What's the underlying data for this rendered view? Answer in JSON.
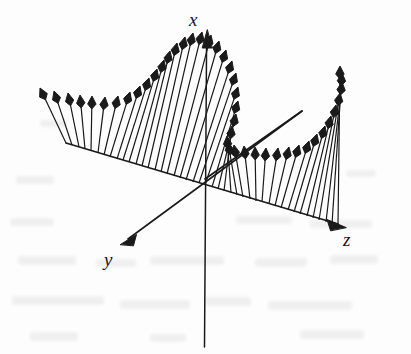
{
  "figure": {
    "kind": "vector-field-3d",
    "title": "",
    "caption": "",
    "background_color": "#fdfdfd",
    "ink_color": "#1a1a1a",
    "width": 411,
    "height": 354
  },
  "axes": {
    "origin": {
      "x": 205,
      "y": 179
    },
    "items": [
      {
        "name": "x",
        "label": "x",
        "label_position": {
          "x": 189,
          "y": 10
        },
        "tip": {
          "x": 207,
          "y": 31
        },
        "tail": {
          "x": 204,
          "y": 347
        },
        "has_arrowhead": true
      },
      {
        "name": "y",
        "label": "y",
        "label_position": {
          "x": 104,
          "y": 250
        },
        "tip": {
          "x": 121,
          "y": 244
        },
        "tail": {
          "x": 302,
          "y": 111
        },
        "has_arrowhead": true
      },
      {
        "name": "z",
        "label": "z",
        "label_position": {
          "x": 343,
          "y": 230
        },
        "tip": {
          "x": 345,
          "y": 227
        },
        "tail": {
          "x": 66,
          "y": 143
        },
        "has_arrowhead": true
      }
    ]
  },
  "chart_data": {
    "type": "scatter",
    "title": "",
    "xlabel": "z",
    "ylabel": "x",
    "zlabel": "y",
    "grid": false,
    "legend_position": "none",
    "base_line": {
      "from": {
        "x": 66,
        "y": 143
      },
      "to": {
        "x": 345,
        "y": 227
      }
    },
    "vector_count": 44,
    "vectors": [
      {
        "t": 0.0,
        "bx": 66,
        "by": 143,
        "tx": 40,
        "ty": 88,
        "len": 61
      },
      {
        "t": 0.022,
        "bx": 72,
        "by": 145,
        "tx": 54,
        "ty": 91,
        "len": 57
      },
      {
        "t": 0.045,
        "bx": 79,
        "by": 147,
        "tx": 68,
        "ty": 93,
        "len": 55
      },
      {
        "t": 0.067,
        "bx": 85,
        "by": 149,
        "tx": 80,
        "ty": 95,
        "len": 54
      },
      {
        "t": 0.09,
        "bx": 91,
        "by": 151,
        "tx": 92,
        "ty": 96,
        "len": 55
      },
      {
        "t": 0.112,
        "bx": 98,
        "by": 153,
        "tx": 105,
        "ty": 97,
        "len": 56
      },
      {
        "t": 0.135,
        "bx": 104,
        "by": 155,
        "tx": 118,
        "ty": 96,
        "len": 60
      },
      {
        "t": 0.157,
        "bx": 110,
        "by": 157,
        "tx": 130,
        "ty": 92,
        "len": 68
      },
      {
        "t": 0.18,
        "bx": 117,
        "by": 159,
        "tx": 140,
        "ty": 86,
        "len": 76
      },
      {
        "t": 0.202,
        "bx": 123,
        "by": 160,
        "tx": 149,
        "ty": 78,
        "len": 86
      },
      {
        "t": 0.225,
        "bx": 129,
        "by": 162,
        "tx": 157,
        "ty": 69,
        "len": 97
      },
      {
        "t": 0.247,
        "bx": 136,
        "by": 164,
        "tx": 164,
        "ty": 60,
        "len": 108
      },
      {
        "t": 0.27,
        "bx": 142,
        "by": 166,
        "tx": 170,
        "ty": 51,
        "len": 118
      },
      {
        "t": 0.292,
        "bx": 148,
        "by": 168,
        "tx": 177,
        "ty": 43,
        "len": 128
      },
      {
        "t": 0.315,
        "bx": 155,
        "by": 170,
        "tx": 185,
        "ty": 37,
        "len": 136
      },
      {
        "t": 0.337,
        "bx": 161,
        "by": 172,
        "tx": 193,
        "ty": 33,
        "len": 142
      },
      {
        "t": 0.36,
        "bx": 167,
        "by": 174,
        "tx": 202,
        "ty": 32,
        "len": 146
      },
      {
        "t": 0.382,
        "bx": 174,
        "by": 176,
        "tx": 211,
        "ty": 35,
        "len": 145
      },
      {
        "t": 0.405,
        "bx": 180,
        "by": 178,
        "tx": 219,
        "ty": 41,
        "len": 142
      },
      {
        "t": 0.427,
        "bx": 186,
        "by": 180,
        "tx": 226,
        "ty": 50,
        "len": 136
      },
      {
        "t": 0.45,
        "bx": 193,
        "by": 182,
        "tx": 232,
        "ty": 61,
        "len": 127
      },
      {
        "t": 0.472,
        "bx": 199,
        "by": 183,
        "tx": 236,
        "ty": 73,
        "len": 116
      },
      {
        "t": 0.495,
        "bx": 205,
        "by": 185,
        "tx": 238,
        "ty": 87,
        "len": 104
      },
      {
        "t": 0.517,
        "bx": 212,
        "by": 187,
        "tx": 238,
        "ty": 101,
        "len": 90
      },
      {
        "t": 0.54,
        "bx": 218,
        "by": 189,
        "tx": 236,
        "ty": 114,
        "len": 77
      },
      {
        "t": 0.562,
        "bx": 224,
        "by": 191,
        "tx": 232,
        "ty": 126,
        "len": 66
      },
      {
        "t": 0.585,
        "bx": 231,
        "by": 193,
        "tx": 227,
        "ty": 136,
        "len": 57
      },
      {
        "t": 0.607,
        "bx": 237,
        "by": 195,
        "tx": 228,
        "ty": 142,
        "len": 54
      },
      {
        "t": 0.63,
        "bx": 243,
        "by": 197,
        "tx": 234,
        "ty": 145,
        "len": 53
      },
      {
        "t": 0.652,
        "bx": 250,
        "by": 199,
        "tx": 244,
        "ty": 146,
        "len": 54
      },
      {
        "t": 0.675,
        "bx": 256,
        "by": 201,
        "tx": 255,
        "ty": 147,
        "len": 54
      },
      {
        "t": 0.697,
        "bx": 262,
        "by": 202,
        "tx": 266,
        "ty": 148,
        "len": 54
      },
      {
        "t": 0.72,
        "bx": 269,
        "by": 204,
        "tx": 278,
        "ty": 148,
        "len": 57
      },
      {
        "t": 0.742,
        "bx": 275,
        "by": 206,
        "tx": 289,
        "ty": 147,
        "len": 61
      },
      {
        "t": 0.765,
        "bx": 281,
        "by": 208,
        "tx": 299,
        "ty": 145,
        "len": 66
      },
      {
        "t": 0.787,
        "bx": 288,
        "by": 210,
        "tx": 309,
        "ty": 141,
        "len": 73
      },
      {
        "t": 0.81,
        "bx": 294,
        "by": 212,
        "tx": 317,
        "ty": 134,
        "len": 81
      },
      {
        "t": 0.832,
        "bx": 300,
        "by": 214,
        "tx": 325,
        "ty": 126,
        "len": 92
      },
      {
        "t": 0.855,
        "bx": 307,
        "by": 216,
        "tx": 331,
        "ty": 116,
        "len": 103
      },
      {
        "t": 0.877,
        "bx": 313,
        "by": 218,
        "tx": 336,
        "ty": 105,
        "len": 115
      },
      {
        "t": 0.9,
        "bx": 319,
        "by": 220,
        "tx": 340,
        "ty": 93,
        "len": 129
      },
      {
        "t": 0.922,
        "bx": 326,
        "by": 222,
        "tx": 342,
        "ty": 82,
        "len": 141
      },
      {
        "t": 0.945,
        "bx": 332,
        "by": 224,
        "tx": 342,
        "ty": 73,
        "len": 152
      },
      {
        "t": 0.967,
        "bx": 338,
        "by": 225,
        "tx": 340,
        "ty": 66,
        "len": 159
      }
    ],
    "ray_z_positive": {
      "from": {
        "x": 205,
        "y": 179
      },
      "to": {
        "x": 302,
        "y": 111
      }
    }
  },
  "style": {
    "stroke_color": "#1a1a1a",
    "axis_stroke_width": 1.6,
    "vector_stroke_width": 1.2,
    "arrowhead_length": 13,
    "arrowhead_halfwidth": 4.2
  }
}
